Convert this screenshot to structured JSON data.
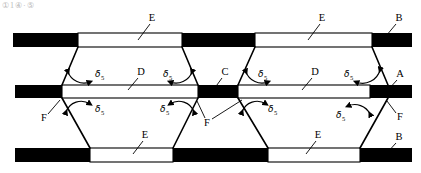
{
  "figure": {
    "title_artifact": "①1④·⑤",
    "background_color": "#ffffff",
    "ink_color": "#000000"
  },
  "labels": {
    "A": "A",
    "B": "B",
    "C": "C",
    "D": "D",
    "E": "E",
    "F": "F",
    "delta_symbol": "δ",
    "delta_subscript": "5"
  },
  "callouts": [
    {
      "id": "E-top-left",
      "text": "E",
      "x": 152,
      "y": 20,
      "tip_x": 140,
      "tip_y": 37
    },
    {
      "id": "E-top-right",
      "text": "E",
      "x": 322,
      "y": 20,
      "tip_x": 310,
      "tip_y": 37
    },
    {
      "id": "B-top-right",
      "text": "B",
      "x": 398,
      "y": 20,
      "tip_x": 388,
      "tip_y": 35
    },
    {
      "id": "D-mid-left",
      "text": "D",
      "x": 140,
      "y": 74,
      "tip_x": 131,
      "tip_y": 87
    },
    {
      "id": "C-center",
      "text": "C",
      "x": 224,
      "y": 74,
      "tip_x": 216,
      "tip_y": 87
    },
    {
      "id": "D-mid-right",
      "text": "D",
      "x": 314,
      "y": 74,
      "tip_x": 305,
      "tip_y": 87
    },
    {
      "id": "A-mid-right",
      "text": "A",
      "x": 399,
      "y": 76,
      "tip_x": 390,
      "tip_y": 88
    },
    {
      "id": "F-mid-left",
      "text": "F",
      "x": 45,
      "y": 118,
      "tip_x": 59,
      "tip_y": 99
    },
    {
      "id": "F-center",
      "text": "F",
      "x": 207,
      "y": 122,
      "tip_x": 198,
      "tip_y": 99
    },
    {
      "id": "F-center-2",
      "text": "F",
      "x": 207,
      "y": 122,
      "tip_x": 240,
      "tip_y": 99
    },
    {
      "id": "F-mid-right",
      "text": "F",
      "x": 398,
      "y": 117,
      "tip_x": 388,
      "tip_y": 100
    },
    {
      "id": "E-bot-left",
      "text": "E",
      "x": 145,
      "y": 137,
      "tip_x": 136,
      "tip_y": 152
    },
    {
      "id": "E-bot-right",
      "text": "E",
      "x": 318,
      "y": 137,
      "tip_x": 308,
      "tip_y": 152
    },
    {
      "id": "B-bot-right",
      "text": "B",
      "x": 398,
      "y": 139,
      "tip_x": 388,
      "tip_y": 152
    }
  ],
  "angles": [
    {
      "id": "delta-1",
      "x": 79,
      "y": 74,
      "position": "upper-left-vertex"
    },
    {
      "id": "delta-2",
      "x": 175,
      "y": 74,
      "position": "upper-center-left"
    },
    {
      "id": "delta-3",
      "x": 257,
      "y": 74,
      "position": "upper-center-right"
    },
    {
      "id": "delta-4",
      "x": 358,
      "y": 74,
      "position": "upper-right-vertex"
    },
    {
      "id": "delta-5",
      "x": 83,
      "y": 111,
      "position": "lower-left-vertex"
    },
    {
      "id": "delta-6",
      "x": 173,
      "y": 111,
      "position": "lower-center-left"
    },
    {
      "id": "delta-7",
      "x": 259,
      "y": 111,
      "position": "lower-center-right"
    },
    {
      "id": "delta-8",
      "x": 356,
      "y": 114,
      "position": "lower-right-vertex"
    }
  ],
  "bars": {
    "top": {
      "y": 33,
      "height": 14,
      "x0": 13,
      "x1": 412,
      "segments": [
        {
          "fill": "#000000",
          "x": 13,
          "w": 65
        },
        {
          "fill": "#ffffff",
          "x": 78,
          "w": 104
        },
        {
          "fill": "#000000",
          "x": 182,
          "w": 73
        },
        {
          "fill": "#ffffff",
          "x": 255,
          "w": 117
        },
        {
          "fill": "#000000",
          "x": 372,
          "w": 40
        }
      ]
    },
    "middle": {
      "y": 85,
      "height": 13,
      "x0": 15,
      "x1": 412,
      "segments": [
        {
          "fill": "#000000",
          "x": 15,
          "w": 47
        },
        {
          "fill": "#ffffff",
          "x": 62,
          "w": 136
        },
        {
          "fill": "#000000",
          "x": 198,
          "w": 40
        },
        {
          "fill": "#ffffff",
          "x": 238,
          "w": 132
        },
        {
          "fill": "#000000",
          "x": 370,
          "w": 42
        }
      ]
    },
    "bottom": {
      "y": 148,
      "height": 14,
      "x0": 15,
      "x1": 412,
      "segments": [
        {
          "fill": "#000000",
          "x": 15,
          "w": 75
        },
        {
          "fill": "#ffffff",
          "x": 90,
          "w": 83
        },
        {
          "fill": "#000000",
          "x": 173,
          "w": 95
        },
        {
          "fill": "#ffffff",
          "x": 268,
          "w": 92
        },
        {
          "fill": "#000000",
          "x": 360,
          "w": 52
        }
      ]
    }
  },
  "diagonals": [
    {
      "id": "d-ul-1",
      "x1": 78,
      "y1": 47,
      "x2": 62,
      "y2": 85
    },
    {
      "id": "d-ul-2",
      "x1": 182,
      "y1": 47,
      "x2": 198,
      "y2": 85
    },
    {
      "id": "d-ur-1",
      "x1": 255,
      "y1": 47,
      "x2": 238,
      "y2": 85
    },
    {
      "id": "d-ur-2",
      "x1": 372,
      "y1": 47,
      "x2": 388,
      "y2": 85
    },
    {
      "id": "d-ll-1",
      "x1": 62,
      "y1": 98,
      "x2": 90,
      "y2": 148
    },
    {
      "id": "d-ll-2",
      "x1": 198,
      "y1": 98,
      "x2": 173,
      "y2": 148
    },
    {
      "id": "d-lr-1",
      "x1": 238,
      "y1": 98,
      "x2": 268,
      "y2": 148
    },
    {
      "id": "d-lr-2",
      "x1": 388,
      "y1": 98,
      "x2": 360,
      "y2": 148
    }
  ]
}
